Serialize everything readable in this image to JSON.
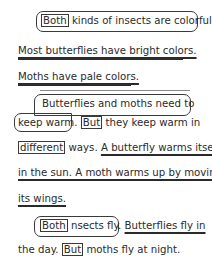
{
  "passage": {
    "p1": {
      "line1": {
        "box": "Both",
        "rest": " kinds of insects are colorful."
      },
      "line2": "Most butterflies have bright colors.",
      "line3": "Moths have pale colors."
    },
    "p2": {
      "line1": "Butterflies and moths need to",
      "line2": {
        "a": "keep warm",
        "b": ".",
        "box": "But",
        "rest": " they keep warm in"
      },
      "line3": {
        "box": "different",
        "a": " ways. ",
        "ul": "A butterfly warms itself"
      },
      "line4": "in the sun. A moth warms up by moving",
      "line5": "its wings."
    },
    "p3": {
      "line1": {
        "box": "Both",
        "a": " nsects fly.",
        "sp": " ",
        "ul": "Butterflies fly in"
      },
      "line2": {
        "a": "the day.",
        "box": "But",
        "rest": " moths fly at night."
      }
    }
  }
}
